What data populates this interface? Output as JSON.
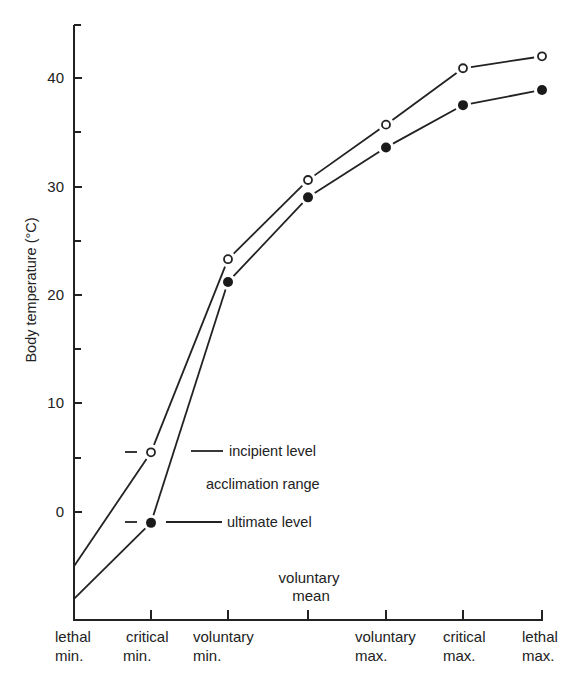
{
  "chart_data": {
    "type": "line",
    "title": "",
    "xlabel": "",
    "ylabel": "Body temperature (°C)",
    "ylim": [
      -10,
      45
    ],
    "yticks_major": [
      0,
      10,
      20,
      30,
      40
    ],
    "yticks_minor": [
      5,
      15,
      25,
      35
    ],
    "grid": false,
    "legend": "inline annotations",
    "categories": [
      [
        "lethal",
        "min."
      ],
      [
        "critical",
        "min."
      ],
      [
        "voluntary",
        "min."
      ],
      [
        "voluntary",
        "mean"
      ],
      [
        "voluntary",
        "max."
      ],
      [
        "critical",
        "max."
      ],
      [
        "lethal",
        "max."
      ]
    ],
    "series": [
      {
        "name": "incipient level",
        "marker": "open-circle",
        "values": [
          -5,
          5.5,
          23.3,
          30.6,
          35.7,
          40.9,
          42
        ]
      },
      {
        "name": "ultimate level",
        "marker": "filled-circle",
        "values": [
          -8,
          -1,
          21.2,
          29,
          33.6,
          37.5,
          38.9
        ]
      }
    ],
    "annotations": [
      {
        "text": "incipient level",
        "near": "critical min. open marker"
      },
      {
        "text": "acclimation range",
        "between": "series"
      },
      {
        "text": "ultimate level",
        "near": "critical min. filled marker"
      }
    ]
  },
  "labels": {
    "ylabel": "Body temperature (°C)",
    "yticks": [
      "0",
      "10",
      "20",
      "30",
      "40"
    ],
    "x0a": "lethal",
    "x0b": "min.",
    "x1a": "critical",
    "x1b": "min.",
    "x2a": "voluntary",
    "x2b": "min.",
    "x3a": "voluntary",
    "x3b": "mean",
    "x4a": "voluntary",
    "x4b": "max.",
    "x5a": "critical",
    "x5b": "max.",
    "x6a": "lethal",
    "x6b": "max.",
    "incipient": "incipient level",
    "acclimation": "acclimation range",
    "ultimate": "ultimate level"
  }
}
